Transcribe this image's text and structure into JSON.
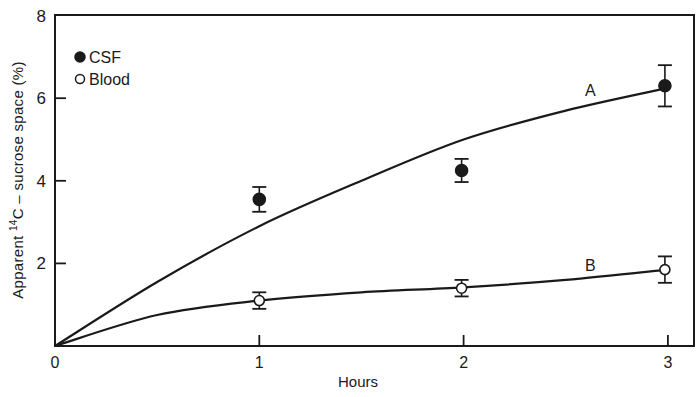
{
  "chart_data": {
    "type": "scatter",
    "title": "",
    "xlabel": "Hours",
    "ylabel": {
      "prefix": "Apparent ",
      "superscript": "14",
      "suffix": "C – sucrose space (%)"
    },
    "xlim": [
      0,
      3.12
    ],
    "ylim": [
      0,
      8
    ],
    "x_ticks": [
      0,
      1,
      2,
      3
    ],
    "x_tick_labels": [
      "0",
      "1",
      "2",
      "3"
    ],
    "y_ticks": [
      0,
      2,
      4,
      6,
      8
    ],
    "y_tick_labels": [
      "",
      "2",
      "4",
      "6",
      "8"
    ],
    "origin_label": "0",
    "grid": false,
    "legend_position": "upper-left-inside",
    "legend": [
      {
        "label": "CSF",
        "marker": "filled-circle"
      },
      {
        "label": "Blood",
        "marker": "open-circle"
      }
    ],
    "series": [
      {
        "name": "CSF",
        "marker": "filled-circle",
        "x": [
          1,
          2,
          3
        ],
        "y": [
          3.55,
          4.25,
          6.3
        ],
        "error": [
          0.3,
          0.28,
          0.5
        ]
      },
      {
        "name": "Blood",
        "marker": "open-circle",
        "x": [
          1,
          2,
          3
        ],
        "y": [
          1.1,
          1.4,
          1.85
        ],
        "error": [
          0.2,
          0.2,
          0.32
        ]
      }
    ],
    "curves": [
      {
        "label": "A",
        "description": "fitted curve for CSF",
        "x": [
          0,
          0.5,
          1,
          1.5,
          2,
          2.5,
          3
        ],
        "y": [
          0,
          1.55,
          2.9,
          4.0,
          5.0,
          5.7,
          6.25
        ],
        "label_position": {
          "x": 2.62,
          "y": 6.2
        }
      },
      {
        "label": "B",
        "description": "fitted curve for Blood",
        "x": [
          0,
          0.5,
          1,
          1.5,
          2,
          2.5,
          3
        ],
        "y": [
          0,
          0.75,
          1.1,
          1.3,
          1.42,
          1.6,
          1.85
        ],
        "label_position": {
          "x": 2.62,
          "y": 1.95
        }
      }
    ]
  }
}
